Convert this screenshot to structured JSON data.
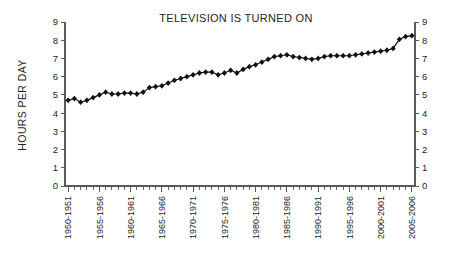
{
  "chart_data": {
    "type": "line",
    "title": "TELEVISION IS TURNED ON",
    "xlabel": "",
    "ylabel": "HOURS PER DAY",
    "ylim": [
      0,
      9
    ],
    "ytick_values": [
      0,
      1,
      2,
      3,
      4,
      5,
      6,
      7,
      8,
      9
    ],
    "ytick_labels": [
      "0",
      "1",
      "2",
      "3",
      "4",
      "5",
      "6",
      "7",
      "8",
      "9"
    ],
    "right_axis": {
      "shown": true,
      "ylim": [
        0,
        9
      ],
      "ytick_labels": [
        "0",
        "1",
        "2",
        "3",
        "4",
        "5",
        "6",
        "7",
        "8",
        "9"
      ]
    },
    "grid": false,
    "legend": null,
    "marker": "diamond",
    "line_color": "#111111",
    "categories": [
      "1950-1951",
      "1951-1952",
      "1952-1953",
      "1953-1954",
      "1954-1955",
      "1955-1956",
      "1956-1957",
      "1957-1958",
      "1958-1959",
      "1959-1960",
      "1960-1961",
      "1961-1962",
      "1962-1963",
      "1963-1964",
      "1964-1965",
      "1965-1966",
      "1966-1967",
      "1967-1968",
      "1968-1969",
      "1969-1970",
      "1970-1971",
      "1971-1972",
      "1972-1973",
      "1973-1974",
      "1974-1975",
      "1975-1976",
      "1976-1977",
      "1977-1978",
      "1978-1979",
      "1979-1980",
      "1980-1981",
      "1981-1982",
      "1982-1983",
      "1983-1984",
      "1984-1985",
      "1985-1986",
      "1986-1987",
      "1987-1988",
      "1988-1989",
      "1989-1990",
      "1990-1991",
      "1991-1992",
      "1992-1993",
      "1993-1994",
      "1994-1995",
      "1995-1996",
      "1996-1997",
      "1997-1998",
      "1998-1999",
      "1999-2000",
      "2000-2001",
      "2001-2002",
      "2002-2003",
      "2003-2004",
      "2004-2005",
      "2005-2006"
    ],
    "xtick_labels_shown": [
      "1950-1951",
      "1955-1956",
      "1960-1961",
      "1965-1966",
      "1970-1971",
      "1975-1976",
      "1980-1981",
      "1985-1986",
      "1990-1991",
      "1995-1996",
      "2000-2001",
      "2005-2006"
    ],
    "values": [
      4.7,
      4.8,
      4.6,
      4.7,
      4.85,
      5.0,
      5.15,
      5.05,
      5.05,
      5.1,
      5.1,
      5.05,
      5.15,
      5.4,
      5.45,
      5.5,
      5.65,
      5.8,
      5.9,
      6.0,
      6.1,
      6.2,
      6.25,
      6.25,
      6.1,
      6.2,
      6.35,
      6.2,
      6.4,
      6.55,
      6.65,
      6.8,
      6.95,
      7.1,
      7.15,
      7.2,
      7.1,
      7.05,
      7.0,
      6.95,
      7.0,
      7.1,
      7.15,
      7.15,
      7.15,
      7.15,
      7.2,
      7.25,
      7.3,
      7.35,
      7.4,
      7.45,
      7.55,
      8.05,
      8.2,
      8.25
    ]
  }
}
